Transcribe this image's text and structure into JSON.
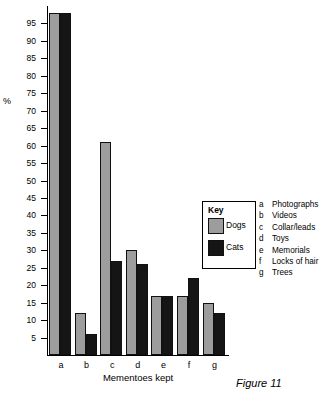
{
  "chart_data": {
    "type": "bar",
    "title": "",
    "xlabel": "Mementoes kept",
    "ylabel": "%",
    "ylim": [
      0,
      100
    ],
    "grid": false,
    "legend_position": "inset-right",
    "categories": [
      "a",
      "b",
      "c",
      "d",
      "e",
      "f",
      "g"
    ],
    "category_descriptions": [
      "Photographs",
      "Videos",
      "Collar/leads",
      "Toys",
      "Memorials",
      "Locks of hair",
      "Trees"
    ],
    "series": [
      {
        "name": "Dogs",
        "color": "#9d9d9d",
        "values": [
          98,
          12,
          61,
          30,
          17,
          17,
          15
        ]
      },
      {
        "name": "Cats",
        "color": "#151515",
        "values": [
          98,
          6,
          27,
          26,
          17,
          22,
          12
        ]
      }
    ],
    "ytick_labels": [
      "95",
      "90",
      "85",
      "80",
      "75",
      "70",
      "65",
      "60",
      "55",
      "50",
      "45",
      "40",
      "35",
      "30",
      "25",
      "20",
      "15",
      "10",
      "5"
    ],
    "ytick_values": [
      95,
      90,
      85,
      80,
      75,
      70,
      65,
      60,
      55,
      50,
      45,
      40,
      35,
      30,
      25,
      20,
      15,
      10,
      5
    ],
    "caption": "Figure 11"
  },
  "key_box": {
    "title": "Key",
    "entries": [
      {
        "label": "Dogs",
        "color": "#9d9d9d"
      },
      {
        "label": "Cats",
        "color": "#151515"
      }
    ]
  },
  "legend_list": [
    {
      "key": "a",
      "desc": "Photographs"
    },
    {
      "key": "b",
      "desc": "Videos"
    },
    {
      "key": "c",
      "desc": "Collar/leads"
    },
    {
      "key": "d",
      "desc": "Toys"
    },
    {
      "key": "e",
      "desc": "Memorials"
    },
    {
      "key": "f",
      "desc": "Locks of hair"
    },
    {
      "key": "g",
      "desc": "Trees"
    }
  ]
}
